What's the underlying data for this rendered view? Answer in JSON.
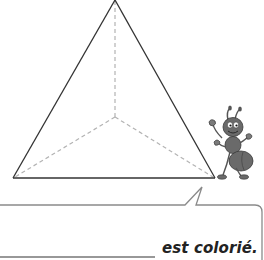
{
  "worksheet": {
    "figure": {
      "shape": "triangular pyramid",
      "description": "Tetrahedron outline with hidden edges dashed",
      "visible_edge_color": "#333333",
      "hidden_edge_color": "#b0b0b0"
    },
    "mascot": {
      "character": "ant",
      "body_color": "#6a6a6a"
    },
    "speech_bubble": {
      "border_color": "#8a8a8a",
      "answer_blank": "",
      "caption": "est colorié."
    }
  }
}
